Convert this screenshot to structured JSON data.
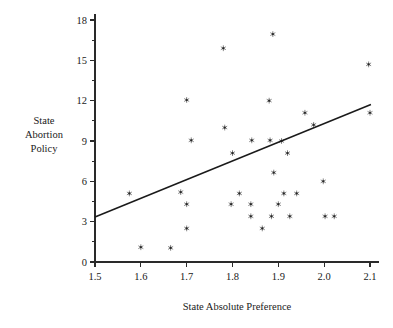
{
  "chart_data": {
    "type": "scatter",
    "title": "",
    "xlabel": "State Absolute Preference",
    "ylabel": "State Abortion Policy",
    "ylabel_lines": [
      "State",
      "Abortion",
      "Policy"
    ],
    "xlim": [
      1.5,
      2.1
    ],
    "ylim": [
      0,
      18
    ],
    "xticks": [
      1.5,
      1.6,
      1.7,
      1.8,
      1.9,
      2.0,
      2.1
    ],
    "xtick_labels": [
      "1.5",
      "1.6",
      "1.7",
      "1.8",
      "1.9",
      "2.0",
      "2.1"
    ],
    "yticks": [
      0,
      3,
      6,
      9,
      12,
      15,
      18
    ],
    "ytick_labels": [
      "0",
      "3",
      "6",
      "9",
      "12",
      "15",
      "18"
    ],
    "y_minor_step": 1.5,
    "grid": false,
    "legend": null,
    "marker_symbol": "asterisk",
    "marker_color": "#262626",
    "points": [
      {
        "x": 1.575,
        "y": 5.1
      },
      {
        "x": 1.6,
        "y": 1.1
      },
      {
        "x": 1.665,
        "y": 1.05
      },
      {
        "x": 1.687,
        "y": 5.2
      },
      {
        "x": 1.7,
        "y": 12.05
      },
      {
        "x": 1.7,
        "y": 4.3
      },
      {
        "x": 1.7,
        "y": 2.5
      },
      {
        "x": 1.71,
        "y": 9.05
      },
      {
        "x": 1.78,
        "y": 15.9
      },
      {
        "x": 1.783,
        "y": 10.0
      },
      {
        "x": 1.797,
        "y": 4.3
      },
      {
        "x": 1.8,
        "y": 8.1
      },
      {
        "x": 1.815,
        "y": 5.1
      },
      {
        "x": 1.84,
        "y": 4.3
      },
      {
        "x": 1.84,
        "y": 3.4
      },
      {
        "x": 1.842,
        "y": 9.05
      },
      {
        "x": 1.865,
        "y": 2.5
      },
      {
        "x": 1.88,
        "y": 12.0
      },
      {
        "x": 1.882,
        "y": 9.05
      },
      {
        "x": 1.885,
        "y": 3.4
      },
      {
        "x": 1.888,
        "y": 16.95
      },
      {
        "x": 1.89,
        "y": 6.65
      },
      {
        "x": 1.9,
        "y": 4.3
      },
      {
        "x": 1.907,
        "y": 9.0
      },
      {
        "x": 1.912,
        "y": 5.1
      },
      {
        "x": 1.92,
        "y": 8.1
      },
      {
        "x": 1.925,
        "y": 3.4
      },
      {
        "x": 1.94,
        "y": 5.1
      },
      {
        "x": 1.958,
        "y": 11.1
      },
      {
        "x": 1.977,
        "y": 10.2
      },
      {
        "x": 1.998,
        "y": 6.0
      },
      {
        "x": 2.002,
        "y": 3.4
      },
      {
        "x": 2.022,
        "y": 3.4
      },
      {
        "x": 2.097,
        "y": 14.7
      },
      {
        "x": 2.1,
        "y": 11.1
      }
    ],
    "fit_line": {
      "x1": 1.5,
      "y1": 3.35,
      "x2": 2.102,
      "y2": 11.72
    }
  }
}
